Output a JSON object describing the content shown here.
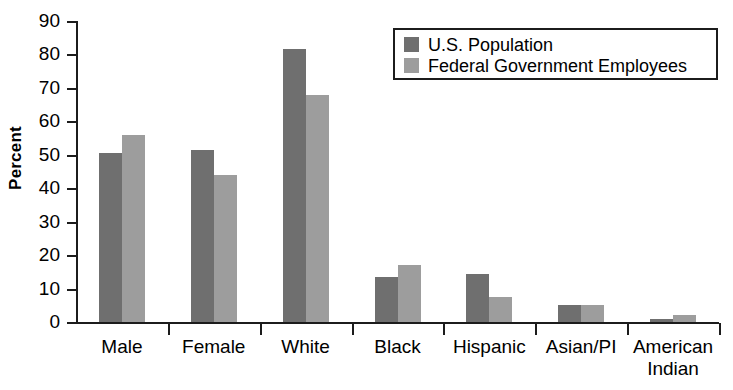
{
  "chart_data": {
    "type": "bar",
    "title": "",
    "xlabel": "",
    "ylabel": "Percent",
    "ylim": [
      0,
      90
    ],
    "yticks": [
      0,
      10,
      20,
      30,
      40,
      50,
      60,
      70,
      80,
      90
    ],
    "ytick_labels": [
      "0",
      "10",
      "20",
      "30",
      "40",
      "50",
      "60",
      "70",
      "80",
      "90"
    ],
    "grid": false,
    "legend_position": "top-right",
    "categories": [
      "Male",
      "Female",
      "White",
      "Black",
      "Hispanic",
      "Asian/PI",
      "American Indian"
    ],
    "category_labels": [
      "Male",
      "Female",
      "White",
      "Black",
      "Hispanic",
      "Asian/PI",
      "American\nIndian"
    ],
    "series": [
      {
        "name": "U.S. Population",
        "color": "#6f6f6f",
        "values": [
          50.5,
          51.5,
          81.5,
          13.5,
          14.5,
          5.0,
          1.0
        ]
      },
      {
        "name": "Federal Government Employees",
        "color": "#9d9d9d",
        "values": [
          56.0,
          44.0,
          68.0,
          17.0,
          7.5,
          5.0,
          2.0
        ]
      }
    ]
  },
  "legend": {
    "entries": [
      {
        "label": "U.S. Population",
        "swatch": "dark-gray-swatch"
      },
      {
        "label": "Federal Government Employees",
        "swatch": "light-gray-swatch"
      }
    ]
  }
}
